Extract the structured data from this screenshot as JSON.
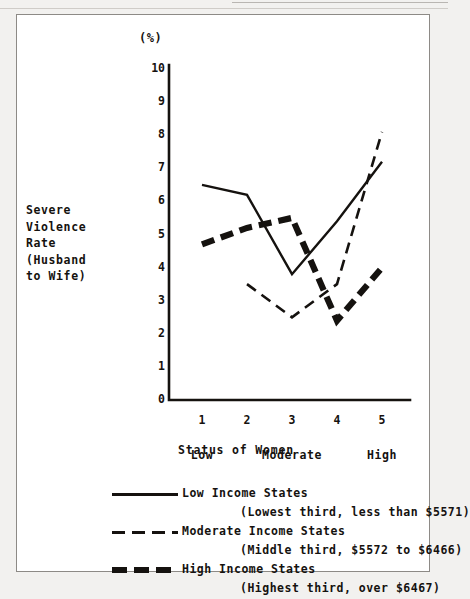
{
  "figure": {
    "unit_label": "(%)",
    "y_axis_caption": "Severe\nViolence\nRate\n(Husband\nto Wife)",
    "x_axis_title": "Status of Women"
  },
  "legend": {
    "entries": [
      {
        "style": "solid",
        "label": "Low Income States",
        "sub": "(Lowest third, less than $5571)"
      },
      {
        "style": "dash",
        "label": "Moderate Income States",
        "sub": "(Middle third, $5572 to $6466)"
      },
      {
        "style": "thick",
        "label": "High Income States",
        "sub": "(Highest third, over $6467)"
      }
    ]
  },
  "chart_data": {
    "type": "line",
    "title": "",
    "xlabel": "Status of Women",
    "ylabel": "Severe Violence Rate (Husband to Wife)",
    "unit": "%",
    "x": [
      1,
      2,
      3,
      4,
      5
    ],
    "xtick_labels": [
      "1",
      "2",
      "3",
      "4",
      "5"
    ],
    "x_category_labels": [
      "Low",
      "Moderate",
      "High"
    ],
    "x_category_positions": [
      1,
      3,
      5
    ],
    "ylim": [
      0,
      10
    ],
    "yticks": [
      0,
      1,
      2,
      3,
      4,
      5,
      6,
      7,
      8,
      9,
      10
    ],
    "ytick_labels": [
      "0",
      "1",
      "2",
      "3",
      "4",
      "5",
      "6",
      "7",
      "8",
      "9",
      "10"
    ],
    "grid": false,
    "legend_position": "below",
    "series": [
      {
        "name": "Low Income States",
        "note": "(Lowest third, less than $5571)",
        "style": "solid",
        "color": "#15120f",
        "x": [
          1,
          2,
          3,
          4,
          5
        ],
        "values": [
          6.5,
          6.2,
          3.8,
          5.4,
          7.2
        ]
      },
      {
        "name": "Moderate Income States",
        "note": "(Middle third, $5572 to $6466)",
        "style": "dashed",
        "color": "#15120f",
        "x": [
          2,
          3,
          4,
          5
        ],
        "values": [
          3.5,
          2.5,
          3.5,
          8.1
        ]
      },
      {
        "name": "High Income States",
        "note": "(Highest third, over $6467)",
        "style": "thick-dashed",
        "color": "#15120f",
        "x": [
          1,
          2,
          3,
          4,
          5
        ],
        "values": [
          4.7,
          5.2,
          5.5,
          2.4,
          4.0
        ]
      }
    ]
  }
}
